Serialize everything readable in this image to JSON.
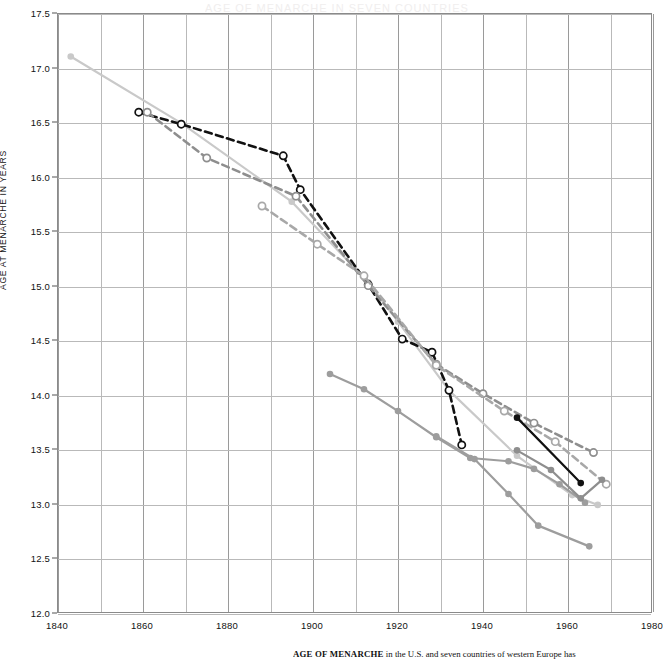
{
  "axes": {
    "ylabel": "AGE AT MENARCHE IN YEARS",
    "ytick_labels": [
      "12.0",
      "12.5",
      "13.0",
      "13.5",
      "14.0",
      "14.5",
      "15.0",
      "15.5",
      "16.0",
      "16.5",
      "17.0",
      "17.5"
    ],
    "xtick_labels": [
      "1840",
      "1860",
      "1880",
      "1900",
      "1920",
      "1940",
      "1960",
      "1980"
    ]
  },
  "ghost": {
    "bleed_text": "AGE OF MENARCHE IN SEVEN COUNTRIES"
  },
  "caption": {
    "lead": "AGE OF MENARCHE",
    "rest": " in the U.S. and seven countries of western Europe has"
  },
  "chart_data": {
    "type": "line",
    "title": "AGE OF MENARCHE in the U.S. and seven countries of western Europe has",
    "xlabel": "",
    "ylabel": "AGE AT MENARCHE IN YEARS",
    "xlim": [
      1840,
      1980
    ],
    "ylim": [
      12.0,
      17.5
    ],
    "ytick_step": 0.5,
    "xtick_step": 20,
    "xminor_step": 10,
    "grid": true,
    "legend": "none",
    "series": [
      {
        "name": "series-a-light-solid",
        "style": "solid",
        "marker": "filled-circle",
        "color": "#c9c9c9",
        "points": [
          [
            1843,
            17.11
          ],
          [
            1869,
            16.5
          ],
          [
            1895,
            15.78
          ],
          [
            1913,
            15.04
          ],
          [
            1920,
            14.68
          ],
          [
            1932,
            14.05
          ],
          [
            1948,
            13.45
          ],
          [
            1961,
            13.09
          ],
          [
            1967,
            13.0
          ]
        ]
      },
      {
        "name": "series-b-black-dashed",
        "style": "dashed",
        "marker": "open-circle",
        "color": "#111111",
        "points": [
          [
            1859,
            16.6
          ],
          [
            1869,
            16.49
          ],
          [
            1893,
            16.2
          ],
          [
            1897,
            15.89
          ],
          [
            1913,
            15.02
          ],
          [
            1921,
            14.52
          ],
          [
            1928,
            14.4
          ],
          [
            1932,
            14.05
          ],
          [
            1935,
            13.55
          ]
        ]
      },
      {
        "name": "series-c-gray-dashed-upper",
        "style": "dashed",
        "marker": "open-circle",
        "color": "#8e8e8e",
        "points": [
          [
            1861,
            16.6
          ],
          [
            1875,
            16.18
          ],
          [
            1896,
            15.83
          ],
          [
            1913,
            15.01
          ],
          [
            1929,
            14.29
          ],
          [
            1940,
            14.02
          ],
          [
            1952,
            13.75
          ],
          [
            1966,
            13.48
          ]
        ]
      },
      {
        "name": "series-d-gray-dashed-lower",
        "style": "dashed",
        "marker": "open-circle",
        "color": "#a8a8a8",
        "points": [
          [
            1888,
            15.74
          ],
          [
            1901,
            15.39
          ],
          [
            1912,
            15.1
          ],
          [
            1929,
            14.28
          ],
          [
            1945,
            13.86
          ],
          [
            1957,
            13.58
          ],
          [
            1969,
            13.19
          ]
        ]
      },
      {
        "name": "series-e-gray-solid-mid",
        "style": "solid",
        "marker": "filled-circle",
        "color": "#9d9d9d",
        "points": [
          [
            1904,
            14.2
          ],
          [
            1912,
            14.06
          ],
          [
            1920,
            13.86
          ],
          [
            1929,
            13.62
          ],
          [
            1937,
            13.43
          ],
          [
            1946,
            13.4
          ],
          [
            1952,
            13.33
          ],
          [
            1958,
            13.19
          ],
          [
            1964,
            13.02
          ]
        ]
      },
      {
        "name": "series-f-gray-solid-lower",
        "style": "solid",
        "marker": "filled-circle",
        "color": "#9d9d9d",
        "points": [
          [
            1929,
            13.63
          ],
          [
            1938,
            13.42
          ],
          [
            1946,
            13.1
          ],
          [
            1953,
            12.81
          ],
          [
            1965,
            12.62
          ]
        ]
      },
      {
        "name": "series-g-gray-solid-short",
        "style": "solid",
        "marker": "filled-circle",
        "color": "#8e8e8e",
        "points": [
          [
            1948,
            13.5
          ],
          [
            1956,
            13.32
          ],
          [
            1963,
            13.06
          ],
          [
            1968,
            13.23
          ]
        ]
      },
      {
        "name": "series-h-black-solid",
        "style": "solid",
        "marker": "filled-circle",
        "color": "#111111",
        "points": [
          [
            1948,
            13.8
          ],
          [
            1963,
            13.2
          ]
        ]
      }
    ]
  }
}
